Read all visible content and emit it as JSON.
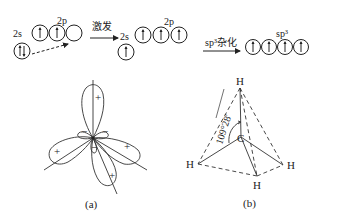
{
  "electron_config": {
    "ground_state": {
      "label_2s": "2s",
      "label_2p": "2p",
      "orbitals_2s": [
        "up-down"
      ],
      "orbitals_2p": [
        "up",
        "up",
        "empty"
      ]
    },
    "excitation_arrow_label": "激发",
    "excited_state": {
      "label_2s": "2s",
      "label_2p": "2p",
      "orbitals_2s": [
        "up"
      ],
      "orbitals_2p": [
        "up",
        "up",
        "up"
      ]
    },
    "hybridization_arrow_label": "sp³杂化",
    "hybrid_state": {
      "label": "sp³",
      "orbitals": [
        "up",
        "up",
        "up",
        "up"
      ]
    }
  },
  "figure_a": {
    "caption": "(a)",
    "lobe_signs": [
      "+",
      "+",
      "+",
      "+",
      "−",
      "−",
      "−"
    ]
  },
  "figure_b": {
    "caption": "(b)",
    "center_atom": "C",
    "atoms": [
      "H",
      "H",
      "H",
      "H"
    ],
    "angle_label": "109°28′"
  }
}
